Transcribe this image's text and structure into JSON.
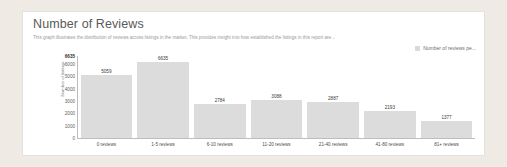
{
  "card": {
    "title": "Number of Reviews",
    "subtitle": "This graph illustrates the distribution of reviews across listings in the market. This provides insight into how established the listings in this report are...",
    "legend_label": "Number of reviews pe...",
    "background": "#ffffff",
    "page_background": "#efeae4",
    "bar_color": "#dcdcdc"
  },
  "chart_data": {
    "type": "bar",
    "title": "Number of Reviews",
    "subtitle": "This graph illustrates the distribution of reviews across listings in the market. This provides insight into how established the listings in this report are...",
    "categories": [
      "0 reviews",
      "1-5 reviews",
      "6-10 reviews",
      "11-20 reviews",
      "21-40 reviews",
      "41-80 reviews",
      "81+ reviews"
    ],
    "values": [
      5059,
      6635,
      2784,
      3088,
      2887,
      2193,
      1377
    ],
    "series": [
      {
        "name": "Number of reviews pe...",
        "values": [
          5059,
          6635,
          2784,
          3088,
          2887,
          2193,
          1377
        ]
      }
    ],
    "xlabel": "",
    "ylabel": "Number of listings",
    "ylim": [
      0,
      6635
    ],
    "yticks": [
      "6635",
      "6000",
      "5000",
      "4000",
      "3000",
      "2000",
      "1000",
      "0"
    ],
    "ytick_values": [
      6635,
      6000,
      5000,
      4000,
      3000,
      2000,
      1000,
      0
    ],
    "grid": false,
    "legend_position": "top-right",
    "data_labels": true
  }
}
